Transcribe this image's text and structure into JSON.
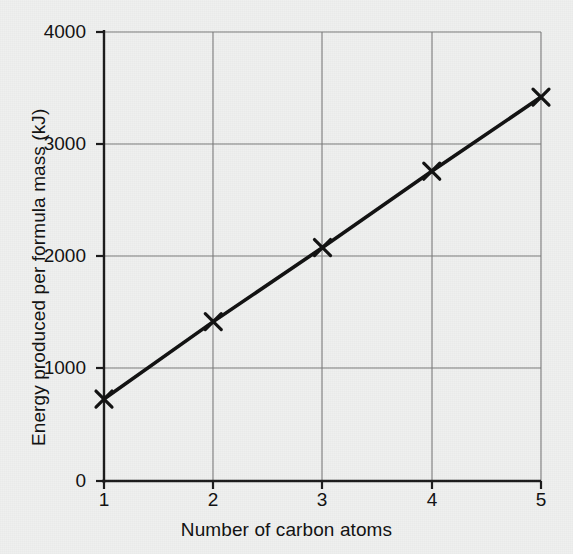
{
  "chart_data": {
    "type": "line",
    "title": "",
    "subtitle": "",
    "xlabel": "Number of carbon atoms",
    "ylabel": "Energy produced per formula mass (kJ)",
    "x": [
      1,
      2,
      3,
      4,
      5
    ],
    "values": [
      730,
      1420,
      2080,
      2760,
      3420
    ],
    "series": [
      {
        "name": "Energy produced per formula mass",
        "x": [
          1,
          2,
          3,
          4,
          5
        ],
        "values": [
          730,
          1420,
          2080,
          2760,
          3420
        ]
      }
    ],
    "xlim": [
      1,
      5
    ],
    "ylim": [
      0,
      4000
    ],
    "xticks": [
      1,
      2,
      3,
      4,
      5
    ],
    "yticks": [
      0,
      1000,
      2000,
      3000,
      4000
    ],
    "xtick_labels": [
      "1",
      "2",
      "3",
      "4",
      "5"
    ],
    "ytick_labels": [
      "0",
      "1000",
      "2000",
      "3000",
      "4000"
    ],
    "grid": true,
    "legend": false,
    "legend_position": "none",
    "marker": "x",
    "line_color": "#111111",
    "grid_color": "#7b7b7b",
    "background_color": "#eff0ef",
    "annotations": []
  },
  "axes": {
    "y_ticks": [
      {
        "label": "4000",
        "value": 4000
      },
      {
        "label": "3000",
        "value": 3000
      },
      {
        "label": "2000",
        "value": 2000
      },
      {
        "label": "1000",
        "value": 1000
      },
      {
        "label": "0",
        "value": 0
      }
    ],
    "x_ticks": [
      {
        "label": "1",
        "value": 1
      },
      {
        "label": "2",
        "value": 2
      },
      {
        "label": "3",
        "value": 3
      },
      {
        "label": "4",
        "value": 4
      },
      {
        "label": "5",
        "value": 5
      }
    ]
  }
}
